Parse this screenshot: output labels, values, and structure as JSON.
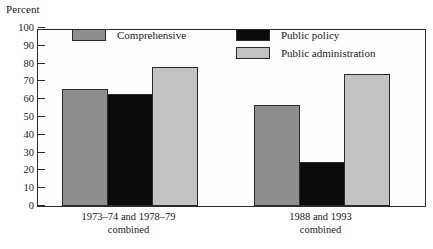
{
  "chart_data": {
    "type": "bar",
    "title": "",
    "ylabel": "Percent",
    "xlabel": "",
    "ylim": [
      0,
      100
    ],
    "yticks": [
      0,
      10,
      20,
      30,
      40,
      50,
      60,
      70,
      80,
      90,
      100
    ],
    "grid": false,
    "legend_position": "inside-top",
    "categories": [
      "1973–74 and 1978–79 combined",
      "1988 and 1993 combined"
    ],
    "category_lines": [
      [
        "1973–74 and 1978–79",
        "combined"
      ],
      [
        "1988 and 1993",
        "combined"
      ]
    ],
    "series": [
      {
        "name": "Comprehensive",
        "color": "#8e8e8e",
        "values": [
          66,
          57
        ]
      },
      {
        "name": "Public policy",
        "color": "#0b0b0b",
        "values": [
          63,
          25
        ]
      },
      {
        "name": "Public administration",
        "color": "#c3c3c3",
        "values": [
          78,
          74
        ]
      }
    ]
  },
  "axis": {
    "unit_label": "Percent",
    "tick_labels": [
      "100",
      "90",
      "80",
      "70",
      "60",
      "50",
      "40",
      "30",
      "20",
      "10",
      "0"
    ]
  },
  "legend": {
    "items": [
      {
        "label": "Comprehensive"
      },
      {
        "label": "Public policy"
      },
      {
        "label": "Public administration"
      }
    ]
  },
  "colors": {
    "comprehensive": "#8e8e8e",
    "public_policy": "#0b0b0b",
    "public_administration": "#c3c3c3",
    "axis": "#2b2b2b",
    "background": "#ffffff"
  }
}
